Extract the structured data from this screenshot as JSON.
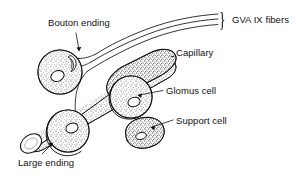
{
  "figure": {
    "type": "anatomical-line-drawing",
    "style": "black ink stipple-shaded line drawing on white",
    "colors": {
      "ink": "#111111",
      "background": "#ffffff",
      "stipple": "#2b2b2b"
    },
    "labels": [
      {
        "id": "bouton-ending",
        "text": "Bouton ending",
        "x": 48,
        "y": 22
      },
      {
        "id": "gva-ix-fibers",
        "text": "GVA IX fibers",
        "x": 232,
        "y": 19
      },
      {
        "id": "capillary",
        "text": "Capillary",
        "x": 176,
        "y": 52
      },
      {
        "id": "glomus-cell",
        "text": "Glomus cell",
        "x": 166,
        "y": 86
      },
      {
        "id": "support-cell",
        "text": "Support cell",
        "x": 176,
        "y": 116
      },
      {
        "id": "large-ending",
        "text": "Large ending",
        "x": 18,
        "y": 162
      }
    ],
    "brace": {
      "id": "fiber-brace",
      "glyph": "}",
      "x": 219,
      "y": 12
    },
    "structures": [
      {
        "id": "nerve-fibers",
        "name": "GVA IX fibers",
        "count": 3
      },
      {
        "id": "capillary-tube",
        "name": "Capillary"
      },
      {
        "id": "bouton-ending-claw",
        "name": "Bouton ending"
      },
      {
        "id": "large-ending-cell",
        "name": "Large ending"
      },
      {
        "id": "glomus-cell-body",
        "name": "Glomus cell"
      },
      {
        "id": "support-cell-body",
        "name": "Support cell"
      }
    ]
  }
}
